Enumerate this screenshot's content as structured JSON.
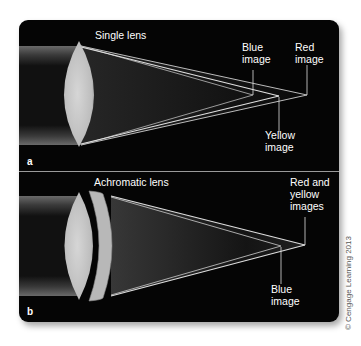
{
  "panels": [
    {
      "letter": "a",
      "title": "Single lens",
      "labels": {
        "blue": "Blue\nimage",
        "red": "Red\nimage",
        "yellow": "Yellow\nimage"
      }
    },
    {
      "letter": "b",
      "title": "Achromatic lens",
      "labels": {
        "red_yellow": "Red and\nyellow\nimages",
        "blue": "Blue\nimage"
      }
    }
  ],
  "copyright": "© Cengage Learning 2013",
  "colors": {
    "background": "#050505",
    "lens": "#d8d8d8",
    "ray": "#cfcfcf",
    "text": "#ffffff"
  }
}
